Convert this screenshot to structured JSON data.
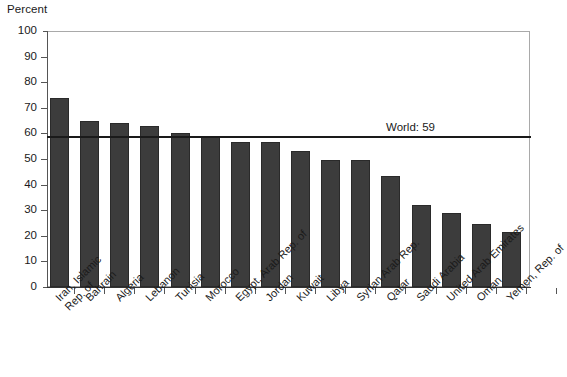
{
  "axis": {
    "ylabel": "Percent",
    "yticks": [
      0,
      10,
      20,
      30,
      40,
      50,
      60,
      70,
      80,
      90,
      100
    ],
    "ytick_labels": [
      "0",
      "10",
      "20",
      "30",
      "40",
      "50",
      "60",
      "70",
      "80",
      "90",
      "100"
    ]
  },
  "annotation": {
    "world_label": "World: 59",
    "world_value": 59
  },
  "colors": {
    "bar_fill": "#3c3c3c",
    "bar_stroke": "#2a2a2a",
    "frame": "#a9a9a9",
    "axis": "#555555",
    "world_line": "#1a1a1a",
    "text": "#1a1a1a",
    "background": "#ffffff"
  },
  "chart_data": {
    "type": "bar",
    "title": "",
    "xlabel": "",
    "ylabel": "Percent",
    "ylim": [
      0,
      100
    ],
    "grid": false,
    "legend": "none",
    "reference_lines": [
      {
        "label": "World: 59",
        "value": 59
      }
    ],
    "categories": [
      "Iran, Islamic\nRep. of",
      "Bahrain",
      "Algeria",
      "Lebanon",
      "Tunisia",
      "Morocco",
      "Egypt, Arab Rep. of",
      "Jordan",
      "Kuwait",
      "Libya",
      "Syrian Arab Rep.",
      "Qatar",
      "Saudi Arabia",
      "United Arab Emirates",
      "Oman",
      "Yemen, Rep. of"
    ],
    "values": [
      74,
      65,
      64,
      63,
      60.3,
      58.5,
      56.5,
      56.5,
      53,
      49.7,
      49.5,
      43.5,
      32,
      29,
      24.5,
      21.5
    ]
  },
  "xlabels": [
    {
      "text": "Iran, Islamic",
      "text2": "Rep. of"
    },
    {
      "text": "Bahrain",
      "text2": ""
    },
    {
      "text": "Algeria",
      "text2": ""
    },
    {
      "text": "Lebanon",
      "text2": ""
    },
    {
      "text": "Tunisia",
      "text2": ""
    },
    {
      "text": "Morocco",
      "text2": ""
    },
    {
      "text": "Egypt, Arab Rep. of",
      "text2": ""
    },
    {
      "text": "Jordan",
      "text2": ""
    },
    {
      "text": "Kuwait",
      "text2": ""
    },
    {
      "text": "Libya",
      "text2": ""
    },
    {
      "text": "Syrian Arab Rep.",
      "text2": ""
    },
    {
      "text": "Qatar",
      "text2": ""
    },
    {
      "text": "Saudi Arabia",
      "text2": ""
    },
    {
      "text": "United Arab Emirates",
      "text2": ""
    },
    {
      "text": "Oman",
      "text2": ""
    },
    {
      "text": "Yemen, Rep. of",
      "text2": ""
    }
  ]
}
